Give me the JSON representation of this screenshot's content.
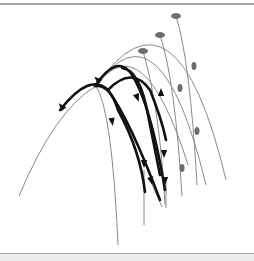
{
  "figure": {
    "colors": {
      "thin_arc": "#8a8a8a",
      "thick_arc": "#111111",
      "marker": "#6e6e6e",
      "rule": "#a8a8a8",
      "band": "#ececec"
    },
    "gray_arcs": [
      {
        "d": "M 96 86 Q 176 -30 226 180",
        "apex": [
          176,
          16
        ]
      },
      {
        "d": "M 96 86 Q 160 -5 206 185",
        "apex": [
          160,
          35
        ]
      },
      {
        "d": "M 96 86 Q 143 22 188 165",
        "apex": [
          143,
          51
        ]
      },
      {
        "d": "M 19 196 Q 55 110 96 86",
        "apex": null
      },
      {
        "d": "M 96 86 Q 112 110 118 245",
        "apex": null
      },
      {
        "d": "M 176 16 Q 190 60 197 185",
        "apex": null
      },
      {
        "d": "M 160 35 Q 175 80 182 196",
        "apex": null
      },
      {
        "d": "M 143 51 Q 160 110 165 205",
        "apex": null
      }
    ],
    "gray_markers": [
      {
        "cx": 176,
        "cy": 16,
        "rx": 5,
        "ry": 3
      },
      {
        "cx": 160,
        "cy": 35,
        "rx": 5,
        "ry": 3
      },
      {
        "cx": 143,
        "cy": 51,
        "rx": 5,
        "ry": 3
      },
      {
        "cx": 194,
        "cy": 66,
        "rx": 2.5,
        "ry": 4
      },
      {
        "cx": 180,
        "cy": 88,
        "rx": 2.5,
        "ry": 4
      },
      {
        "cx": 197,
        "cy": 131,
        "rx": 2.5,
        "ry": 4
      },
      {
        "cx": 182,
        "cy": 168,
        "rx": 2.5,
        "ry": 4
      }
    ],
    "black_arcs": [
      {
        "d": "M 60 110 Q 90 72 108 90 Q 130 120 160 200"
      },
      {
        "d": "M 95 86 Q 110 84 118 110 Q 140 150 145 192"
      },
      {
        "d": "M 95 86 Q 116 55 130 72 Q 150 100 165 190"
      },
      {
        "d": "M 122 68 Q 140 70 148 115 Q 155 150 160 175"
      },
      {
        "d": "M 108 90 Q 132 65 150 90 Q 162 120 166 140"
      }
    ],
    "arrows": [
      {
        "x": 62,
        "y": 107,
        "angle": 230
      },
      {
        "x": 98,
        "y": 80,
        "angle": 220
      },
      {
        "x": 112,
        "y": 121,
        "angle": 80
      },
      {
        "x": 144,
        "y": 163,
        "angle": 90
      },
      {
        "x": 137,
        "y": 97,
        "angle": 70
      },
      {
        "x": 164,
        "y": 153,
        "angle": 90
      },
      {
        "x": 161,
        "y": 93,
        "angle": 270
      },
      {
        "x": 165,
        "y": 180,
        "angle": 90
      },
      {
        "x": 151,
        "y": 180,
        "angle": 75
      }
    ],
    "thin_tails": [
      {
        "d": "M 144 170 L 144 225"
      },
      {
        "d": "M 151 182 L 162 207"
      },
      {
        "d": "M 166 180 L 166 208"
      }
    ]
  }
}
